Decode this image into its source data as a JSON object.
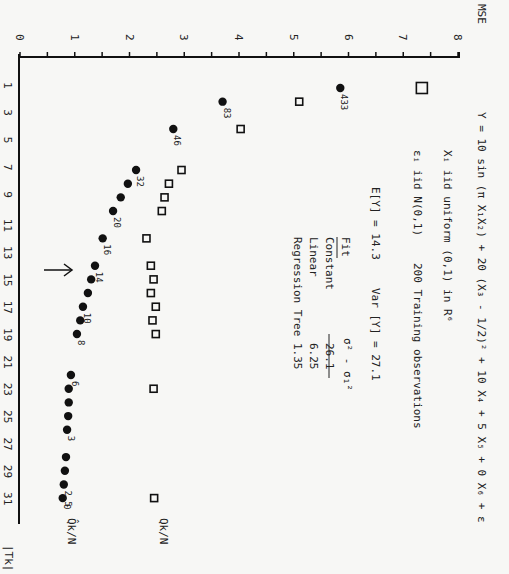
{
  "chart_data": {
    "type": "scatter",
    "orientation": "rotated 90 degrees clockwise (MSE axis along top, |T_k| axis down left side)",
    "xlabel": "|T_k|",
    "ylabel": "MSE",
    "x_ticks": [
      1,
      3,
      5,
      7,
      9,
      11,
      13,
      15,
      17,
      19,
      21,
      23,
      25,
      27,
      29,
      31
    ],
    "y_ticks": [
      0,
      1,
      2,
      3,
      4,
      5,
      6,
      7,
      8
    ],
    "xlim": [
      0,
      32
    ],
    "ylim": [
      0,
      8
    ],
    "grid": false,
    "annotations": {
      "line1": "Y = 10 sin (π X₁X₂) + 20 (X₃ - 1/2)² + 10 X₄ + 5 X₅ + 0 X₆ + ε",
      "line2": "Xᵢ iid uniform (0,1) in R⁶",
      "line3a": "εᵢ iid N(0,1)",
      "line3b": "200 Training observations",
      "line4a": "E[Y] = 14.3",
      "line4b": "Var [Y] = 27.1",
      "table_header_fit": "Fit",
      "table_header_value": "σ² - σ₁²",
      "table_rows": [
        {
          "fit": "Constant",
          "value": "26.1"
        },
        {
          "fit": "Linear",
          "value": "6.25"
        },
        {
          "fit": "Regression Tree",
          "value": "1.35"
        }
      ],
      "arrow_at_Tk": 14
    },
    "series": [
      {
        "name": "Q̂_k/N",
        "marker": "filled-circle",
        "x": [
          1,
          2,
          4,
          7,
          8,
          9,
          10,
          12,
          14,
          15,
          16,
          17,
          18,
          19,
          22,
          23,
          24,
          25,
          26,
          28,
          29,
          30,
          31
        ],
        "y": [
          5.85,
          3.7,
          2.8,
          2.12,
          1.97,
          1.84,
          1.7,
          1.51,
          1.37,
          1.3,
          1.24,
          1.15,
          1.1,
          1.04,
          0.93,
          0.89,
          0.89,
          0.88,
          0.86,
          0.84,
          0.82,
          0.8,
          0.78
        ],
        "point_labels": [
          {
            "x": 1,
            "label": "433"
          },
          {
            "x": 2,
            "label": "83"
          },
          {
            "x": 4,
            "label": "46"
          },
          {
            "x": 7,
            "label": "32"
          },
          {
            "x": 10,
            "label": "20"
          },
          {
            "x": 12,
            "label": "16"
          },
          {
            "x": 14,
            "label": "14"
          },
          {
            "x": 17,
            "label": "10"
          },
          {
            "x": 19,
            "label": "8"
          },
          {
            "x": 22,
            "label": "6"
          },
          {
            "x": 26,
            "label": "3"
          },
          {
            "x": 30,
            "label": "2.5"
          },
          {
            "x": 31,
            "label": "0"
          }
        ]
      },
      {
        "name": "Q_k/N",
        "marker": "open-square",
        "x": [
          1,
          2,
          4,
          7,
          8,
          9,
          10,
          12,
          14,
          15,
          16,
          17,
          18,
          19,
          23,
          31
        ],
        "y": [
          7.34,
          5.1,
          4.03,
          2.95,
          2.72,
          2.64,
          2.59,
          2.31,
          2.39,
          2.44,
          2.39,
          2.48,
          2.42,
          2.48,
          2.44,
          2.45
        ]
      }
    ],
    "legend": {
      "circle_label": "Q̂k/N",
      "square_label": "Qk/N",
      "position": "end of series (bottom)"
    }
  },
  "axes": {
    "mse_label": "MSE",
    "tk_label": "|Tk|",
    "mse_ticks": [
      "0",
      "1",
      "2",
      "3",
      "4",
      "5",
      "6",
      "7",
      "8"
    ],
    "tk_ticks": [
      "1",
      "3",
      "5",
      "7",
      "9",
      "11",
      "13",
      "15",
      "17",
      "19",
      "21",
      "23",
      "25",
      "27",
      "29",
      "31"
    ]
  }
}
